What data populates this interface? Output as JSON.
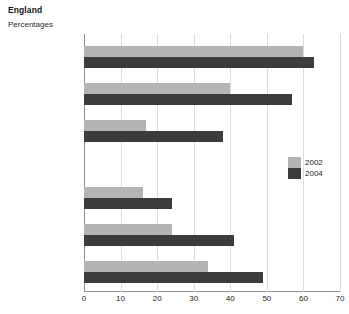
{
  "header": {
    "title": "England",
    "subtitle": "Percentages"
  },
  "legend": {
    "position": "middle-right",
    "entries": [
      {
        "label": "2002",
        "color": "#b4b4b4"
      },
      {
        "label": "2004",
        "color": "#3c3c3c"
      }
    ]
  },
  "colors": {
    "series_2002": "#b4b4b4",
    "series_2004": "#3c3c3c",
    "gridline": "#dcdcdc",
    "axis": "#8d8d8d",
    "background": "#ffffff",
    "text": "#1b1b1b"
  },
  "chart_data": {
    "type": "bar",
    "orientation": "horizontal",
    "title": "England",
    "subtitle": "Percentages",
    "xlabel": "",
    "ylabel": "",
    "xlim": [
      0,
      70
    ],
    "xticks": [
      0,
      10,
      20,
      30,
      40,
      50,
      60,
      70
    ],
    "xtick_labels": [
      "0",
      "10",
      "20",
      "30",
      "40",
      "50",
      "60",
      "70"
    ],
    "grid": true,
    "grid_axis": "x",
    "legend": [
      "2002",
      "2004"
    ],
    "categories": [
      "Primary English",
      "Primary\nmathematics",
      "Primary science",
      "Secondary English",
      "Secondary\nmathematics",
      "Secondary science"
    ],
    "series": [
      {
        "name": "2002",
        "color": "#b4b4b4",
        "values": [
          60,
          40,
          17,
          16,
          24,
          34
        ]
      },
      {
        "name": "2004",
        "color": "#3c3c3c",
        "values": [
          63,
          57,
          38,
          24,
          41,
          49
        ]
      }
    ]
  }
}
